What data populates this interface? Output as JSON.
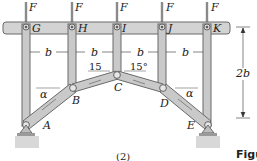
{
  "diagram": {
    "type": "truss-frame",
    "loads": [
      {
        "label": "F",
        "at": "G"
      },
      {
        "label": "F",
        "at": "H"
      },
      {
        "label": "F",
        "at": "I"
      },
      {
        "label": "F",
        "at": "J"
      },
      {
        "label": "F",
        "at": "K"
      }
    ],
    "top_pins": [
      "G",
      "H",
      "I",
      "J",
      "K"
    ],
    "bottom_joints": [
      "A",
      "B",
      "C",
      "D",
      "E"
    ],
    "spacing_labels": [
      "b",
      "b",
      "b",
      "b"
    ],
    "angle_left_inner": "15",
    "angle_right_inner": "15°",
    "angle_left_outer": "α",
    "angle_right_outer": "α",
    "height_label": "2b",
    "sub_caption": "(2)",
    "figure_caption": "Figu"
  },
  "colors": {
    "member_fill": "#c9c9c9",
    "member_stroke": "#6a6a6a",
    "beam_fill": "#d3d3d3",
    "ground": "#d8d8d8",
    "text": "#222222"
  }
}
